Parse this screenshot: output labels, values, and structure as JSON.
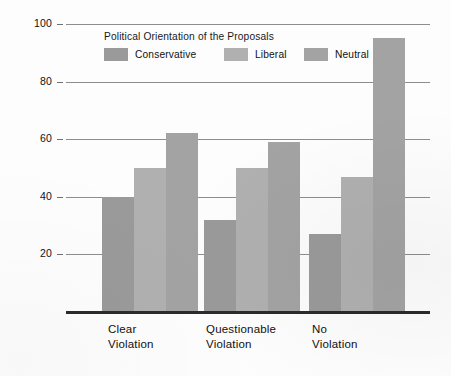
{
  "chart_data": {
    "type": "bar",
    "title": "",
    "xlabel": "",
    "ylabel": "Percent Approved",
    "ylim": [
      0,
      100
    ],
    "yticks": [
      20,
      40,
      60,
      80,
      100
    ],
    "grid": true,
    "legend_position": "upper-left-inside",
    "legend_title": "Political Orientation of the Proposals",
    "categories": [
      "Clear Violation",
      "Questionable Violation",
      "No Violation"
    ],
    "category_lines": [
      [
        "Clear",
        "Violation"
      ],
      [
        "Questionable",
        "Violation"
      ],
      [
        "No",
        "Violation"
      ]
    ],
    "series": [
      {
        "name": "Conservative",
        "color": "#9a9a9a",
        "values": [
          40,
          32,
          27
        ]
      },
      {
        "name": "Liberal",
        "color": "#b0b0b0",
        "values": [
          50,
          50,
          47
        ]
      },
      {
        "name": "Neutral",
        "color": "#a3a3a3",
        "values": [
          62,
          59,
          95
        ]
      }
    ]
  },
  "axis": {
    "y_title": "Percent Approved",
    "y_tick_labels": [
      "100",
      "80",
      "60",
      "40",
      "20"
    ]
  },
  "legend": {
    "title": "Political Orientation of the Proposals",
    "items": [
      {
        "label": "Conservative",
        "color": "#9a9a9a"
      },
      {
        "label": "Liberal",
        "color": "#b0b0b0"
      },
      {
        "label": "Neutral",
        "color": "#a3a3a3"
      }
    ]
  },
  "colors": {
    "conservative": "#9a9a9a",
    "liberal": "#b0b0b0",
    "neutral": "#a3a3a3",
    "gridline": "#8d8d8d",
    "baseline": "#2b2b2b",
    "text": "#101010",
    "background": "#fdfdfd"
  }
}
